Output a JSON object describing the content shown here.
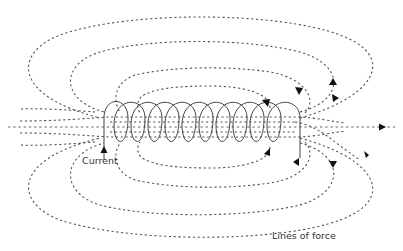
{
  "diagram": {
    "labels": {
      "current": "Current",
      "lines_of_force": "Lines of force"
    },
    "caption": "",
    "colors": {
      "field_lines": "#555555",
      "coil": "#444444",
      "arrows": "#111111",
      "text": "#333333",
      "background": "#ffffff"
    },
    "coil_turns": 11
  }
}
